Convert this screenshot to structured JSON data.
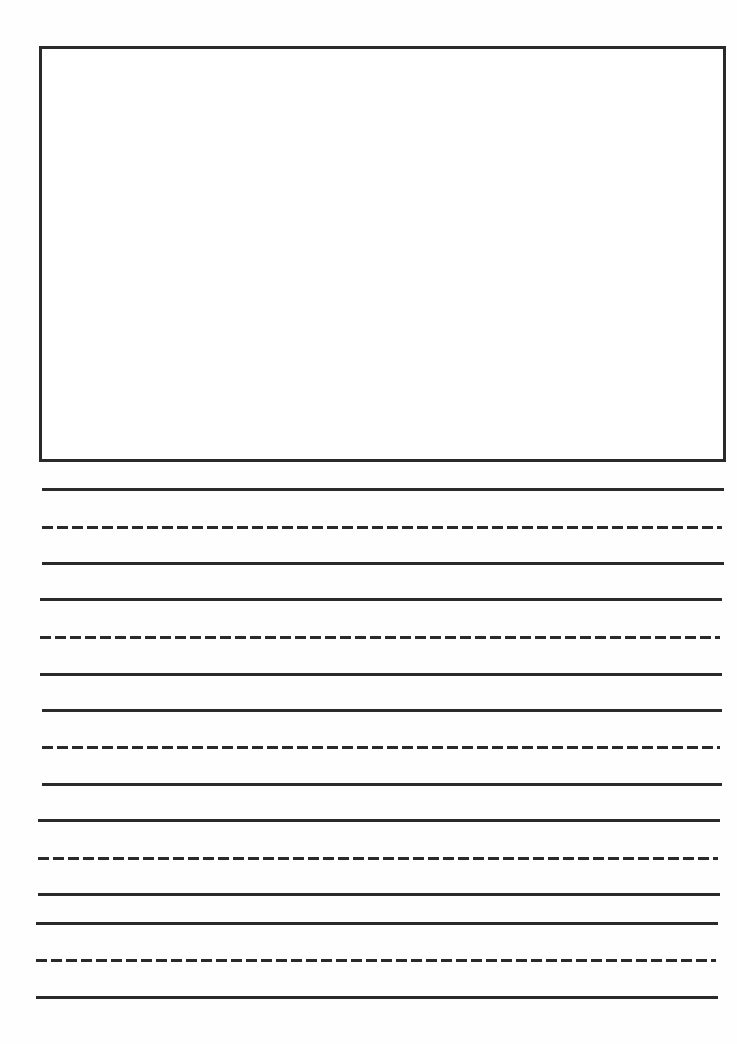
{
  "page": {
    "type": "primary-writing-paper",
    "background": "#ffffff",
    "line_color": "#2a2a2a"
  },
  "drawing_box": {
    "label": ""
  },
  "writing_lines": [
    {
      "style": "solid",
      "y": 488,
      "x1": 42,
      "x2": 724
    },
    {
      "style": "dashed",
      "y": 526,
      "x1": 42,
      "x2": 722
    },
    {
      "style": "solid",
      "y": 562,
      "x1": 42,
      "x2": 724
    },
    {
      "style": "solid",
      "y": 598,
      "x1": 40,
      "x2": 722
    },
    {
      "style": "dashed",
      "y": 636,
      "x1": 40,
      "x2": 720
    },
    {
      "style": "solid",
      "y": 673,
      "x1": 40,
      "x2": 722
    },
    {
      "style": "solid",
      "y": 709,
      "x1": 42,
      "x2": 722
    },
    {
      "style": "dashed",
      "y": 746,
      "x1": 42,
      "x2": 720
    },
    {
      "style": "solid",
      "y": 783,
      "x1": 42,
      "x2": 722
    },
    {
      "style": "solid",
      "y": 819,
      "x1": 38,
      "x2": 720
    },
    {
      "style": "dashed",
      "y": 857,
      "x1": 38,
      "x2": 718
    },
    {
      "style": "solid",
      "y": 893,
      "x1": 38,
      "x2": 720
    },
    {
      "style": "solid",
      "y": 922,
      "x1": 36,
      "x2": 718
    },
    {
      "style": "dashed",
      "y": 959,
      "x1": 36,
      "x2": 716
    },
    {
      "style": "solid",
      "y": 996,
      "x1": 36,
      "x2": 718
    }
  ]
}
